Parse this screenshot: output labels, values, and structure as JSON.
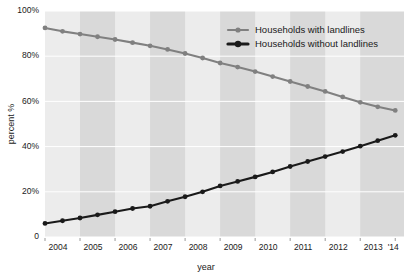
{
  "chart_data": {
    "type": "line",
    "title": "",
    "xlabel": "year",
    "ylabel": "percent %",
    "ylim": [
      0,
      100
    ],
    "xlim": [
      2004.0,
      2014.25
    ],
    "grid": true,
    "legend_position": "top-right",
    "y_ticks": [
      0,
      20,
      40,
      60,
      80,
      100
    ],
    "y_tick_labels": [
      "0",
      "20%",
      "40%",
      "60%",
      "80%",
      "100%"
    ],
    "x_ticks": [
      2004,
      2005,
      2006,
      2007,
      2008,
      2009,
      2010,
      2011,
      2012,
      2013,
      2014
    ],
    "x_tick_labels": [
      "2004",
      "2005",
      "2006",
      "2007",
      "2008",
      "2009",
      "2010",
      "2011",
      "2012",
      "2013",
      "'14"
    ],
    "x": [
      2004.0,
      2004.5,
      2005.0,
      2005.5,
      2006.0,
      2006.5,
      2007.0,
      2007.5,
      2008.0,
      2008.5,
      2009.0,
      2009.5,
      2010.0,
      2010.5,
      2011.0,
      2011.5,
      2012.0,
      2012.5,
      2013.0,
      2013.5,
      2014.0
    ],
    "series": [
      {
        "name": "Households with landlines",
        "color": "#808080",
        "marker": "circle",
        "values": [
          92.5,
          91.0,
          89.8,
          88.6,
          87.4,
          86.0,
          84.6,
          83.0,
          81.2,
          79.2,
          77.0,
          75.2,
          73.2,
          71.0,
          68.8,
          66.6,
          64.4,
          62.0,
          59.6,
          57.6,
          56.0
        ]
      },
      {
        "name": "Households without landlines",
        "color": "#1a1a1a",
        "marker": "circle",
        "values": [
          6.0,
          7.2,
          8.4,
          9.8,
          11.2,
          12.6,
          13.6,
          15.8,
          17.8,
          20.0,
          22.6,
          24.6,
          26.6,
          28.8,
          31.2,
          33.4,
          35.6,
          37.8,
          40.2,
          42.6,
          45.0
        ]
      }
    ],
    "bands": [
      {
        "start": 2004.0,
        "end": 2005.0,
        "shaded": false
      },
      {
        "start": 2005.0,
        "end": 2006.0,
        "shaded": true
      },
      {
        "start": 2006.0,
        "end": 2007.0,
        "shaded": false
      },
      {
        "start": 2007.0,
        "end": 2008.0,
        "shaded": true
      },
      {
        "start": 2008.0,
        "end": 2009.0,
        "shaded": false
      },
      {
        "start": 2009.0,
        "end": 2010.0,
        "shaded": true
      },
      {
        "start": 2010.0,
        "end": 2011.0,
        "shaded": false
      },
      {
        "start": 2011.0,
        "end": 2012.0,
        "shaded": true
      },
      {
        "start": 2012.0,
        "end": 2013.0,
        "shaded": false
      },
      {
        "start": 2013.0,
        "end": 2014.25,
        "shaded": true
      }
    ]
  },
  "legend": {
    "entries": [
      {
        "label": "Households with landlines",
        "color": "#808080"
      },
      {
        "label": "Households without landlines",
        "color": "#1a1a1a"
      }
    ]
  },
  "axes": {
    "x_title": "year",
    "y_title": "percent %"
  }
}
